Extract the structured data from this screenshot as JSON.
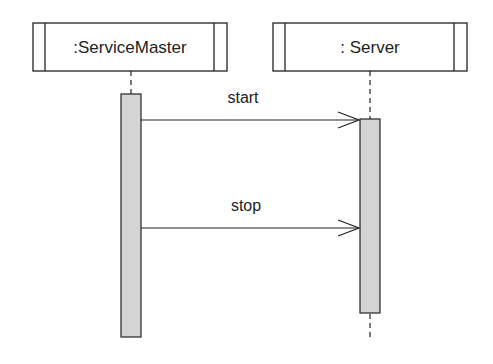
{
  "diagram": {
    "type": "uml-sequence",
    "participants": [
      {
        "id": "servicemaster",
        "label": ":ServiceMaster"
      },
      {
        "id": "server",
        "label": ": Server"
      }
    ],
    "messages": [
      {
        "from": "servicemaster",
        "to": "server",
        "label": "start"
      },
      {
        "from": "servicemaster",
        "to": "server",
        "label": "stop"
      }
    ],
    "colors": {
      "line": "#222222",
      "activation_fill": "#d4d4d4",
      "background": "#ffffff"
    }
  }
}
